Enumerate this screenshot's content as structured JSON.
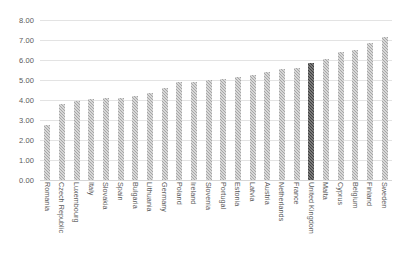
{
  "chart_data": {
    "type": "bar",
    "title": "",
    "subtitle": "",
    "xlabel": "",
    "ylabel": "",
    "ylim": [
      0,
      8
    ],
    "ytick_step": 1,
    "ytick_labels": [
      "0.00",
      "1.00",
      "2.00",
      "3.00",
      "4.00",
      "5.00",
      "6.00",
      "7.00",
      "8.00"
    ],
    "ytick_values": [
      0,
      1,
      2,
      3,
      4,
      5,
      6,
      7,
      8
    ],
    "grid": true,
    "legend": "none",
    "bar_color": "#a6a6a6",
    "highlight_color": "#404040",
    "highlight_category": "United Kingdom",
    "categories": [
      "Romania",
      "Czech Republic",
      "Luxembourg",
      "Italy",
      "Slovakia",
      "Spain",
      "Bulgaria",
      "Lithuania",
      "Germany",
      "Poland",
      "Ireland",
      "Slovenia",
      "Portugal",
      "Estonia",
      "Latvia",
      "Austria",
      "Netherlands",
      "France",
      "United Kingdom",
      "Malta",
      "Cyprus",
      "Belgium",
      "Finland",
      "Sweden"
    ],
    "values": [
      2.75,
      3.82,
      3.97,
      4.05,
      4.08,
      4.12,
      4.2,
      4.37,
      4.62,
      4.9,
      4.92,
      5.0,
      5.03,
      5.13,
      5.27,
      5.42,
      5.55,
      5.58,
      5.87,
      6.05,
      6.42,
      6.5,
      6.85,
      7.15
    ]
  }
}
